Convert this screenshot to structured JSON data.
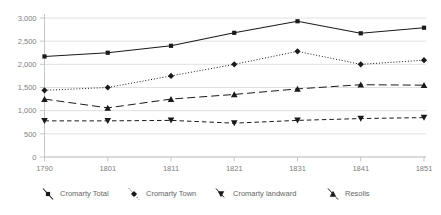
{
  "chart_data": {
    "type": "line",
    "title": "",
    "subtitle": "",
    "xlabel": "",
    "ylabel": "",
    "categories": [
      "1790",
      "1801",
      "1811",
      "1821",
      "1831",
      "1841",
      "1851"
    ],
    "x_tick_labels": [
      "1790",
      "1801",
      "1811",
      "1821",
      "1831",
      "1841",
      "1851"
    ],
    "y_tick_labels": [
      "0",
      "500",
      "1,000",
      "1,500",
      "2,000",
      "2,500",
      "3,000"
    ],
    "y_tick_values": [
      0,
      500,
      1000,
      1500,
      2000,
      2500,
      3000
    ],
    "ylim": [
      0,
      3000
    ],
    "grid": "horizontal",
    "legend_position": "bottom",
    "series": [
      {
        "name": "Cromarty Total",
        "marker": "square",
        "line_style": "solid",
        "color": "#1a1a1a",
        "values": [
          2170,
          2250,
          2400,
          2680,
          2930,
          2670,
          2790
        ]
      },
      {
        "name": "Cromarty Town",
        "marker": "diamond",
        "line_style": "dotted",
        "color": "#1a1a1a",
        "values": [
          1440,
          1500,
          1750,
          2000,
          2280,
          2000,
          2090
        ]
      },
      {
        "name": "Cromarty landward",
        "marker": "triangle-down",
        "line_style": "dashed",
        "color": "#1a1a1a",
        "values": [
          780,
          780,
          790,
          730,
          790,
          830,
          850
        ]
      },
      {
        "name": "Resolis",
        "marker": "triangle-up",
        "line_style": "long-dash",
        "color": "#1a1a1a",
        "values": [
          1250,
          1060,
          1250,
          1350,
          1470,
          1560,
          1550
        ]
      }
    ]
  },
  "legend": {
    "items": [
      {
        "label": "Cromarty Total",
        "marker": "square"
      },
      {
        "label": "Cromarty Town",
        "marker": "diamond"
      },
      {
        "label": "Cromarty landward",
        "marker": "triangle-down"
      },
      {
        "label": "Resolis",
        "marker": "triangle-up"
      }
    ]
  },
  "colors": {
    "ink": "#1a1a1a",
    "grid": "#d9d9d9",
    "axis": "#bfbfbf",
    "tick_text": "#808080",
    "legend_text": "#666666",
    "background": "#ffffff"
  }
}
